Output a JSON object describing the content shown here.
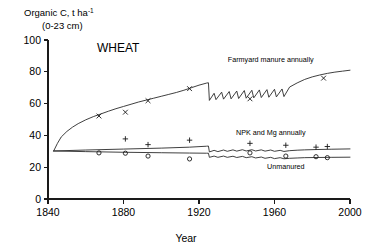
{
  "chart_data": {
    "type": "line",
    "title": "WHEAT",
    "xlabel": "Year",
    "ylabel": "Organic C, t ha⁻¹",
    "ylabel_line2": "(0-23 cm)",
    "ylabel_main": "Organic C, t ha",
    "ylabel_sup": "-1",
    "xlim": [
      1840,
      2000
    ],
    "ylim": [
      0,
      100
    ],
    "xticks": [
      1840,
      1880,
      1920,
      1960,
      2000
    ],
    "yticks": [
      0,
      20,
      40,
      60,
      80,
      100
    ],
    "xtick_labels": [
      "1840",
      "1880",
      "1920",
      "1960",
      "2000"
    ],
    "ytick_labels": [
      "0",
      "20",
      "40",
      "60",
      "80",
      "100"
    ],
    "grid": false,
    "legend_position": "inline-annotations",
    "series": [
      {
        "name": "Farmyard manure annually",
        "label": "Farmyard manure annually",
        "marker": "x",
        "label_x": 1958,
        "label_y": 86,
        "line": [
          [
            1843,
            30.2
          ],
          [
            1845,
            35.0
          ],
          [
            1847,
            39.0
          ],
          [
            1850,
            42.5
          ],
          [
            1853,
            45.2
          ],
          [
            1856,
            47.4
          ],
          [
            1860,
            49.8
          ],
          [
            1864,
            51.8
          ],
          [
            1868,
            53.5
          ],
          [
            1872,
            55.2
          ],
          [
            1876,
            56.8
          ],
          [
            1880,
            58.2
          ],
          [
            1884,
            59.6
          ],
          [
            1888,
            61.0
          ],
          [
            1892,
            62.2
          ],
          [
            1896,
            63.4
          ],
          [
            1900,
            64.6
          ],
          [
            1904,
            65.8
          ],
          [
            1908,
            67.0
          ],
          [
            1912,
            68.4
          ],
          [
            1916,
            70.0
          ],
          [
            1920,
            71.6
          ],
          [
            1924,
            72.9
          ],
          [
            1925,
            73.1
          ],
          [
            1925.5,
            62.0
          ],
          [
            1928,
            66.5
          ],
          [
            1929,
            62.5
          ],
          [
            1932,
            67.2
          ],
          [
            1933,
            62.8
          ],
          [
            1936,
            67.6
          ],
          [
            1937,
            63.0
          ],
          [
            1940,
            67.9
          ],
          [
            1941,
            63.2
          ],
          [
            1944,
            68.2
          ],
          [
            1945,
            63.4
          ],
          [
            1948,
            68.4
          ],
          [
            1949,
            63.6
          ],
          [
            1952,
            68.6
          ],
          [
            1953,
            63.8
          ],
          [
            1956,
            68.8
          ],
          [
            1957,
            64.0
          ],
          [
            1960,
            69.0
          ],
          [
            1961,
            64.2
          ],
          [
            1964,
            69.2
          ],
          [
            1965,
            64.4
          ],
          [
            1968,
            70.4
          ],
          [
            1972,
            73.0
          ],
          [
            1976,
            75.2
          ],
          [
            1980,
            76.8
          ],
          [
            1984,
            78.0
          ],
          [
            1988,
            79.0
          ],
          [
            1992,
            79.8
          ],
          [
            1996,
            80.4
          ],
          [
            2000,
            81.0
          ]
        ],
        "points": [
          [
            1867,
            52.2
          ],
          [
            1881,
            54.6
          ],
          [
            1893,
            61.8
          ],
          [
            1915,
            69.4
          ],
          [
            1947,
            63.0
          ],
          [
            1986,
            76.0
          ]
        ]
      },
      {
        "name": "NPK and Mg annually",
        "label": "NPK and Mg annually",
        "marker": "+",
        "label_x": 1958,
        "label_y": 40,
        "line": [
          [
            1843,
            30.2
          ],
          [
            1860,
            30.8
          ],
          [
            1880,
            31.4
          ],
          [
            1900,
            32.0
          ],
          [
            1915,
            32.6
          ],
          [
            1924,
            33.2
          ],
          [
            1925,
            33.3
          ],
          [
            1925.5,
            29.6
          ],
          [
            1928,
            30.6
          ],
          [
            1930,
            29.8
          ],
          [
            1933,
            30.8
          ],
          [
            1935,
            30.0
          ],
          [
            1938,
            30.9
          ],
          [
            1940,
            30.1
          ],
          [
            1943,
            31.0
          ],
          [
            1945,
            30.2
          ],
          [
            1948,
            31.0
          ],
          [
            1950,
            30.2
          ],
          [
            1953,
            30.9
          ],
          [
            1955,
            30.1
          ],
          [
            1958,
            30.8
          ],
          [
            1960,
            30.0
          ],
          [
            1963,
            30.6
          ],
          [
            1965,
            29.9
          ],
          [
            1968,
            30.4
          ],
          [
            1972,
            30.7
          ],
          [
            1976,
            30.9
          ],
          [
            1982,
            31.1
          ],
          [
            1990,
            31.3
          ],
          [
            2000,
            31.5
          ]
        ],
        "points": [
          [
            1881,
            37.8
          ],
          [
            1893,
            34.2
          ],
          [
            1915,
            37.0
          ],
          [
            1947,
            35.0
          ],
          [
            1966,
            33.8
          ],
          [
            1982,
            32.6
          ],
          [
            1988,
            33.0
          ]
        ]
      },
      {
        "name": "Unmanured",
        "label": "Unmanured",
        "marker": "o",
        "label_x": 1966,
        "label_y": 19,
        "line": [
          [
            1843,
            30.2
          ],
          [
            1860,
            29.8
          ],
          [
            1880,
            29.4
          ],
          [
            1900,
            29.1
          ],
          [
            1915,
            28.9
          ],
          [
            1924,
            28.8
          ],
          [
            1925,
            28.8
          ],
          [
            1925.5,
            26.2
          ],
          [
            1928,
            27.0
          ],
          [
            1930,
            26.2
          ],
          [
            1933,
            27.0
          ],
          [
            1935,
            26.2
          ],
          [
            1938,
            26.9
          ],
          [
            1940,
            26.1
          ],
          [
            1943,
            26.8
          ],
          [
            1945,
            26.0
          ],
          [
            1948,
            26.6
          ],
          [
            1950,
            25.8
          ],
          [
            1953,
            26.4
          ],
          [
            1955,
            25.6
          ],
          [
            1958,
            26.2
          ],
          [
            1960,
            25.4
          ],
          [
            1963,
            26.0
          ],
          [
            1965,
            25.3
          ],
          [
            1968,
            25.6
          ],
          [
            1972,
            25.8
          ],
          [
            1976,
            26.0
          ],
          [
            1982,
            26.1
          ],
          [
            1990,
            26.2
          ],
          [
            2000,
            26.3
          ]
        ],
        "points": [
          [
            1867,
            29.0
          ],
          [
            1881,
            28.8
          ],
          [
            1893,
            27.0
          ],
          [
            1915,
            25.2
          ],
          [
            1947,
            29.0
          ],
          [
            1966,
            27.0
          ],
          [
            1982,
            26.6
          ],
          [
            1988,
            26.0
          ]
        ]
      }
    ]
  }
}
